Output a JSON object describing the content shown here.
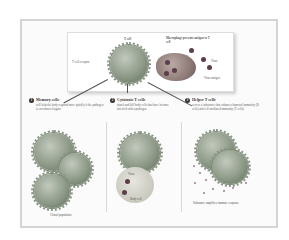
{
  "figure": {
    "top": {
      "tcell_label": "T cell",
      "receptor_label": "T cell receptor",
      "macrophage_label": "Macrophage presents antigen to T cell",
      "virus_label": "Virus",
      "antigen_label": "Virus antigen"
    },
    "sections": [
      {
        "number": "1",
        "title": "Memory cells",
        "text": "will help the body respond more quickly if the pathogen is encountered again",
        "caption": "Clonal population"
      },
      {
        "number": "2",
        "title": "Cytotoxic T cells",
        "text": "attack and kill body cells that have become infected with a pathogen",
        "labels": [
          "Virus",
          "Body cell"
        ]
      },
      {
        "number": "3",
        "title": "Helper T cells",
        "text": "secrete a substance that enhances humoral immunity (B cells) and cell-mediated immunity (T cells)",
        "caption": "Substance amplifies immune response"
      }
    ]
  },
  "colors": {
    "frame": "#d4d4d4",
    "tcell": "#8e9a88",
    "macrophage": "#8f7b78",
    "virus": "#5b3e4a"
  }
}
